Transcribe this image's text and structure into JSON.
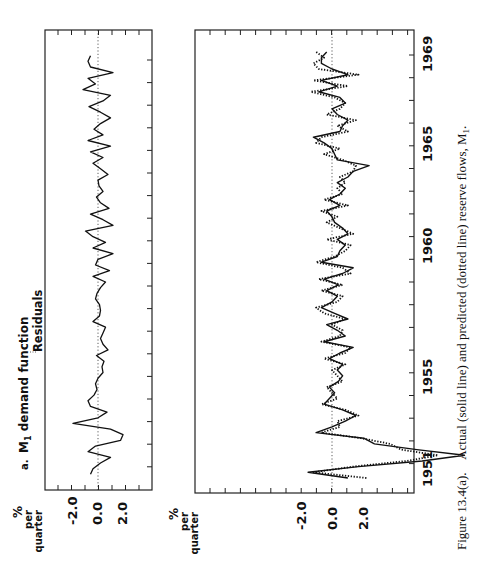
{
  "figure": {
    "caption_label": "Figure 13.4(a).",
    "caption_text": "Actual (solid line) and predicted (dotted line) reserve flows, M",
    "caption_subscript": "1",
    "caption_end": ".",
    "orientation": "rotated 90° counterclockwise"
  },
  "chart_data": [
    {
      "type": "line",
      "title": "a. M1 demand function",
      "title_prefix": "a.",
      "title_main": "M",
      "title_sub": "1",
      "title_rest": " demand function",
      "annotation": "Residuals",
      "ylabel": "% per quarter",
      "ylabel_lines": [
        "%",
        "per",
        "quarter"
      ],
      "ytick_labels": [
        "2.0",
        "0.0",
        "-2.0"
      ],
      "yticks": [
        2.0,
        0.0,
        -2.0
      ],
      "xlabel": "",
      "xrange": [
        1951,
        1969.75
      ],
      "ylim": [
        -6,
        10
      ],
      "grid": false,
      "zero_line": "dotted",
      "series": [
        {
          "name": "Residuals",
          "style": "solid",
          "x": [
            1951.0,
            1951.25,
            1951.5,
            1951.75,
            1952.0,
            1952.25,
            1952.5,
            1952.75,
            1953.0,
            1953.25,
            1953.5,
            1953.75,
            1954.0,
            1954.25,
            1954.5,
            1954.75,
            1955.0,
            1955.25,
            1955.5,
            1955.75,
            1956.0,
            1956.25,
            1956.5,
            1956.75,
            1957.0,
            1957.25,
            1957.5,
            1957.75,
            1958.0,
            1958.25,
            1958.5,
            1958.75,
            1959.0,
            1959.25,
            1959.5,
            1959.75,
            1960.0,
            1960.25,
            1960.5,
            1960.75,
            1961.0,
            1961.25,
            1961.5,
            1961.75,
            1962.0,
            1962.25,
            1962.5,
            1962.75,
            1963.0,
            1963.25,
            1963.5,
            1963.75,
            1964.0,
            1964.25,
            1964.5,
            1964.75,
            1965.0,
            1965.25,
            1965.5,
            1965.75,
            1966.0,
            1966.25,
            1966.5,
            1966.75,
            1967.0,
            1967.25,
            1967.5,
            1967.75,
            1968.0,
            1968.25,
            1968.5,
            1968.75,
            1969.0,
            1969.25,
            1969.5
          ],
          "values": [
            -1.5,
            -1.0,
            0.5,
            2.5,
            -2.0,
            -0.5,
            4.5,
            5.0,
            2.5,
            -5.0,
            0.0,
            1.8,
            -1.5,
            -2.0,
            -0.8,
            -0.2,
            -0.5,
            0.0,
            1.0,
            0.8,
            1.2,
            -0.3,
            2.0,
            1.0,
            0.5,
            1.0,
            1.5,
            -1.0,
            0.3,
            0.5,
            0.3,
            -0.5,
            -0.2,
            0.5,
            1.5,
            -1.0,
            2.3,
            -0.5,
            0.0,
            3.0,
            -1.0,
            1.5,
            -1.0,
            -2.5,
            3.0,
            1.0,
            -1.5,
            2.2,
            0.5,
            -0.3,
            1.0,
            0.2,
            0.0,
            2.0,
            0.5,
            -1.0,
            1.0,
            -1.5,
            2.5,
            -2.0,
            1.0,
            -0.8,
            0.5,
            2.5,
            0.5,
            -1.8,
            1.0,
            2.5,
            -3.0,
            -0.5,
            -2.0,
            3.0,
            -1.5,
            -2.0,
            -1.5
          ]
        }
      ]
    },
    {
      "type": "line",
      "title": "Actual (solid line) and predicted (dotted line) reserve flows, M1",
      "ylabel": "% per quarter",
      "ylabel_lines": [
        "%",
        "per",
        "quarter"
      ],
      "ytick_labels": [
        "2.0",
        "0.0",
        "-2.0"
      ],
      "yticks": [
        2.0,
        0.0,
        -2.0
      ],
      "xlabel": "",
      "xtick_labels": [
        "1951",
        "1955",
        "1960",
        "1965",
        "1969"
      ],
      "xticks": [
        1951,
        1955,
        1960,
        1965,
        1969
      ],
      "xrange": [
        1950.5,
        1970.5
      ],
      "ylim": [
        -6,
        28
      ],
      "grid": false,
      "zero_line": "dotted",
      "series": [
        {
          "name": "Actual",
          "style": "solid",
          "x": [
            1950.75,
            1951.0,
            1951.25,
            1951.5,
            1951.75,
            1952.0,
            1952.25,
            1952.5,
            1952.75,
            1953.0,
            1953.25,
            1953.5,
            1953.75,
            1954.0,
            1954.25,
            1954.5,
            1954.75,
            1955.0,
            1955.25,
            1955.5,
            1955.75,
            1956.0,
            1956.25,
            1956.5,
            1956.75,
            1957.0,
            1957.25,
            1957.5,
            1957.75,
            1958.0,
            1958.25,
            1958.5,
            1958.75,
            1959.0,
            1959.25,
            1959.5,
            1959.75,
            1960.0,
            1960.25,
            1960.5,
            1960.75,
            1961.0,
            1961.25,
            1961.5,
            1961.75,
            1962.0,
            1962.25,
            1962.5,
            1962.75,
            1963.0,
            1963.25,
            1963.5,
            1963.75,
            1964.0,
            1964.25,
            1964.5,
            1964.75,
            1965.0,
            1965.25,
            1965.5,
            1965.75,
            1966.0,
            1966.25,
            1966.5,
            1966.75,
            1967.0,
            1967.25,
            1967.5,
            1967.75,
            1968.0,
            1968.25,
            1968.5,
            1968.75,
            1969.0,
            1969.25,
            1969.5
          ],
          "values": [
            3.0,
            -4.5,
            5.0,
            17.0,
            25.0,
            16.0,
            8.0,
            6.0,
            -3.0,
            0.0,
            2.5,
            4.5,
            2.0,
            -1.5,
            -0.5,
            0.5,
            -0.5,
            1.2,
            2.0,
            1.0,
            2.0,
            -0.5,
            1.5,
            4.0,
            -1.5,
            2.5,
            1.0,
            -1.0,
            3.0,
            0.5,
            -2.0,
            0.0,
            1.0,
            -1.0,
            1.2,
            -1.5,
            2.0,
            4.0,
            -2.0,
            1.0,
            1.5,
            2.5,
            1.0,
            3.0,
            2.0,
            0.5,
            0.0,
            -1.0,
            1.5,
            -0.5,
            1.5,
            2.5,
            1.0,
            3.0,
            4.0,
            7.0,
            1.0,
            0.5,
            0.0,
            -1.5,
            -3.5,
            1.5,
            2.0,
            3.0,
            1.0,
            0.0,
            2.5,
            1.5,
            -2.5,
            1.0,
            -2.0,
            3.0,
            0.0,
            -2.0,
            -2.0,
            -1.0
          ]
        },
        {
          "name": "Predicted",
          "style": "dotted",
          "x": [
            1950.75,
            1951.0,
            1951.25,
            1951.5,
            1951.75,
            1952.0,
            1952.25,
            1952.5,
            1952.75,
            1953.0,
            1953.25,
            1953.5,
            1953.75,
            1954.0,
            1954.25,
            1954.5,
            1954.75,
            1955.0,
            1955.25,
            1955.5,
            1955.75,
            1956.0,
            1956.25,
            1956.5,
            1956.75,
            1957.0,
            1957.25,
            1957.5,
            1957.75,
            1958.0,
            1958.25,
            1958.5,
            1958.75,
            1959.0,
            1959.25,
            1959.5,
            1959.75,
            1960.0,
            1960.25,
            1960.5,
            1960.75,
            1961.0,
            1961.25,
            1961.5,
            1961.75,
            1962.0,
            1962.25,
            1962.5,
            1962.75,
            1963.0,
            1963.25,
            1963.5,
            1963.75,
            1964.0,
            1964.25,
            1964.5,
            1964.75,
            1965.0,
            1965.25,
            1965.5,
            1965.75,
            1966.0,
            1966.25,
            1966.5,
            1966.75,
            1967.0,
            1967.25,
            1967.5,
            1967.75,
            1968.0,
            1968.25,
            1968.5,
            1968.75,
            1969.0,
            1969.25,
            1969.5
          ],
          "values": [
            6.5,
            -3.5,
            4.0,
            14.0,
            20.0,
            13.0,
            11.0,
            5.5,
            -2.0,
            1.5,
            1.0,
            5.0,
            2.5,
            -2.0,
            1.0,
            0.0,
            -1.0,
            2.0,
            1.0,
            0.0,
            2.5,
            -1.5,
            2.5,
            3.5,
            -2.0,
            1.5,
            2.0,
            0.0,
            2.5,
            -1.5,
            -3.0,
            1.0,
            2.0,
            -2.0,
            2.0,
            -2.5,
            3.5,
            2.0,
            -3.0,
            0.5,
            2.5,
            3.5,
            -1.0,
            4.0,
            1.5,
            -1.0,
            1.0,
            -2.0,
            3.0,
            -1.5,
            2.0,
            1.0,
            2.5,
            1.5,
            4.0,
            4.5,
            2.0,
            -1.5,
            1.5,
            -3.0,
            -2.0,
            3.0,
            1.0,
            4.5,
            -1.0,
            1.5,
            2.5,
            0.5,
            -4.0,
            3.0,
            -3.5,
            5.0,
            -2.5,
            -3.5,
            -1.5,
            -3.0
          ]
        }
      ]
    }
  ]
}
